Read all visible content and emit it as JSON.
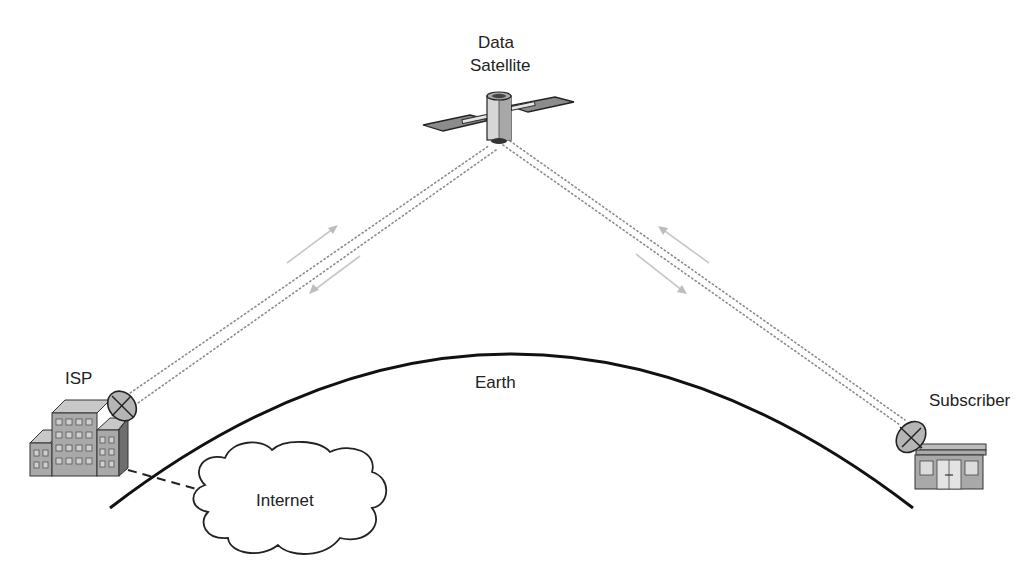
{
  "diagram": {
    "nodes": {
      "satellite": {
        "label_line1": "Data",
        "label_line2": "Satellite",
        "icon": "satellite-icon"
      },
      "isp": {
        "label": "ISP",
        "icon": "office-building-icon"
      },
      "subscriber": {
        "label": "Subscriber",
        "icon": "house-icon"
      },
      "internet": {
        "label": "Internet",
        "icon": "cloud-icon"
      },
      "earth": {
        "label": "Earth",
        "icon": "earth-arc"
      }
    },
    "links": [
      {
        "from": "isp",
        "to": "satellite",
        "style": "dotted",
        "direction": "bidirectional"
      },
      {
        "from": "satellite",
        "to": "subscriber",
        "style": "dotted",
        "direction": "bidirectional"
      },
      {
        "from": "isp",
        "to": "internet",
        "style": "dashed",
        "direction": "none"
      }
    ],
    "colors": {
      "line": "#111111",
      "signal": "#8a8a8a",
      "arrow": "#c8c8c8",
      "building": "#a9a9a9",
      "background": "#ffffff"
    }
  }
}
